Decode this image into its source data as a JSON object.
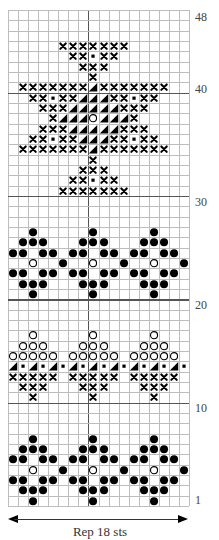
{
  "chart_data": {
    "type": "table",
    "grid": {
      "columns": 18,
      "rows": 48,
      "heavy_vertical_after_col": 8,
      "heavy_horizontal_above_rows": [
        10,
        20,
        30,
        40
      ]
    },
    "row_labels": [
      {
        "label": "48",
        "row": 48
      },
      {
        "label": "40",
        "row": 40
      },
      {
        "label": "30",
        "row": 30
      },
      {
        "label": "20",
        "row": 20
      },
      {
        "label": "10",
        "row": 10
      },
      {
        "label": "1",
        "row": 1
      }
    ],
    "footer": "Rep 18 sts",
    "legend_symbols": {
      "x": "cross",
      "d": "filled dot",
      "o": "open circle",
      "t": "half-filled triangle",
      "s": "small square"
    },
    "rows": {
      "45": {
        "x": [
          5,
          6,
          7,
          8,
          9,
          10,
          11
        ]
      },
      "44": {
        "x": [
          6,
          7,
          9,
          10
        ],
        "s": [
          8
        ]
      },
      "43": {
        "x": [
          7,
          8,
          9
        ]
      },
      "42": {
        "x": [
          8
        ]
      },
      "41": {
        "x": [
          1,
          2,
          3,
          4,
          5,
          6,
          7,
          9,
          10,
          11,
          12,
          13,
          14,
          15
        ],
        "t": [
          8
        ]
      },
      "40": {
        "x": [
          2,
          3,
          5,
          6,
          10,
          11,
          13,
          14
        ],
        "s": [
          4,
          12
        ],
        "t": [
          7,
          8,
          9
        ]
      },
      "39": {
        "x": [
          3,
          4,
          5,
          11,
          12,
          13
        ],
        "t": [
          6,
          7,
          8,
          9,
          10
        ]
      },
      "38": {
        "x": [
          4,
          12
        ],
        "t": [
          5,
          6,
          7,
          9,
          10,
          11
        ],
        "o": [
          8
        ]
      },
      "37": {
        "x": [
          3,
          4,
          5,
          11,
          12,
          13
        ],
        "t": [
          6,
          7,
          8,
          9,
          10
        ]
      },
      "36": {
        "x": [
          2,
          3,
          5,
          6,
          10,
          11,
          13,
          14
        ],
        "s": [
          4,
          12
        ],
        "t": [
          7,
          8,
          9
        ]
      },
      "35": {
        "x": [
          1,
          2,
          3,
          4,
          5,
          6,
          7,
          9,
          10,
          11,
          12,
          13,
          14,
          15
        ],
        "t": [
          8
        ]
      },
      "34": {
        "x": [
          8
        ]
      },
      "33": {
        "x": [
          7,
          8,
          9
        ]
      },
      "32": {
        "x": [
          6,
          7,
          9,
          10
        ],
        "s": [
          8
        ]
      },
      "31": {
        "x": [
          5,
          6,
          7,
          8,
          9,
          10,
          11
        ]
      },
      "27": {
        "d": [
          2,
          8,
          14
        ]
      },
      "26": {
        "d": [
          1,
          2,
          3,
          7,
          8,
          9,
          13,
          14,
          15
        ]
      },
      "25": {
        "d": [
          0,
          1,
          3,
          4,
          6,
          7,
          9,
          10,
          12,
          13,
          15,
          16
        ]
      },
      "24": {
        "o": [
          2,
          8,
          14
        ],
        "d": [
          5,
          11,
          17
        ]
      },
      "23": {
        "d": [
          0,
          1,
          3,
          4,
          6,
          7,
          9,
          10,
          12,
          13,
          15,
          16
        ]
      },
      "22": {
        "d": [
          1,
          2,
          3,
          7,
          8,
          9,
          13,
          14,
          15
        ]
      },
      "21": {
        "d": [
          2,
          8,
          14
        ]
      },
      "17": {
        "o": [
          2,
          8,
          14
        ]
      },
      "16": {
        "o": [
          1,
          2,
          3,
          7,
          8,
          9,
          13,
          14,
          15
        ]
      },
      "15": {
        "o": [
          0,
          1,
          2,
          3,
          4,
          6,
          7,
          8,
          9,
          10,
          12,
          13,
          14,
          15,
          16
        ]
      },
      "14": {
        "t": [
          0,
          2,
          4,
          6,
          8,
          10,
          12,
          14,
          16
        ],
        "s": [
          1,
          3,
          5,
          7,
          9,
          11,
          13,
          15,
          17
        ]
      },
      "13": {
        "x": [
          0,
          1,
          2,
          3,
          4,
          6,
          7,
          8,
          9,
          10,
          12,
          13,
          14,
          15,
          16
        ]
      },
      "12": {
        "x": [
          1,
          2,
          3,
          7,
          8,
          9,
          13,
          14,
          15
        ]
      },
      "11": {
        "x": [
          2,
          8,
          14
        ]
      },
      "7": {
        "d": [
          2,
          8,
          14
        ]
      },
      "6": {
        "d": [
          1,
          2,
          3,
          7,
          8,
          9,
          13,
          14,
          15
        ]
      },
      "5": {
        "d": [
          0,
          1,
          3,
          4,
          6,
          7,
          9,
          10,
          12,
          13,
          15,
          16
        ]
      },
      "4": {
        "o": [
          2,
          8,
          14
        ],
        "d": [
          5,
          11,
          17
        ]
      },
      "3": {
        "d": [
          0,
          1,
          3,
          4,
          6,
          7,
          9,
          10,
          12,
          13,
          15,
          16
        ]
      },
      "2": {
        "d": [
          1,
          2,
          3,
          7,
          8,
          9,
          13,
          14,
          15
        ]
      },
      "1": {
        "d": [
          2,
          8,
          14
        ]
      }
    }
  },
  "footer": {
    "label": "Rep 18 sts"
  },
  "labels": {
    "r48": "48",
    "r40": "40",
    "r30": "30",
    "r20": "20",
    "r10": "10",
    "r1": "1"
  }
}
